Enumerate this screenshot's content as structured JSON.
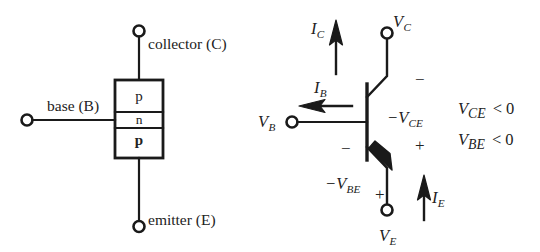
{
  "figure": {
    "type": "pnp-bipolar-junction-transistor-diagram",
    "background_color": "#ffffff",
    "line_color": "#1a1a1a"
  },
  "structure_panel": {
    "name": "pnp layer structure",
    "terminals": {
      "collector_label": "collector (C)",
      "base_label": "base (B)",
      "emitter_label": "emitter (E)"
    },
    "layers": [
      {
        "symbol": "p",
        "weight": "normal"
      },
      {
        "symbol": "n",
        "weight": "normal"
      },
      {
        "symbol": "p",
        "weight": "bold"
      }
    ]
  },
  "symbol_panel": {
    "name": "pnp circuit symbol",
    "node_labels": {
      "collector_voltage": "V",
      "collector_voltage_sub": "C",
      "base_voltage": "V",
      "base_voltage_sub": "B",
      "emitter_voltage": "V",
      "emitter_voltage_sub": "E"
    },
    "currents": [
      {
        "symbol": "I",
        "sub": "C",
        "direction": "up"
      },
      {
        "symbol": "I",
        "sub": "B",
        "direction": "left"
      },
      {
        "symbol": "I",
        "sub": "E",
        "direction": "up"
      }
    ],
    "voltages": [
      {
        "text": "−V",
        "sub": "CE",
        "plus_sign": "+",
        "minus_sign": "−"
      },
      {
        "text": "−V",
        "sub": "BE",
        "plus_sign": "+",
        "minus_sign": "−"
      }
    ],
    "conditions": [
      {
        "symbol": "V",
        "sub": "CE",
        "relation": "< 0"
      },
      {
        "symbol": "V",
        "sub": "BE",
        "relation": "< 0"
      }
    ]
  }
}
